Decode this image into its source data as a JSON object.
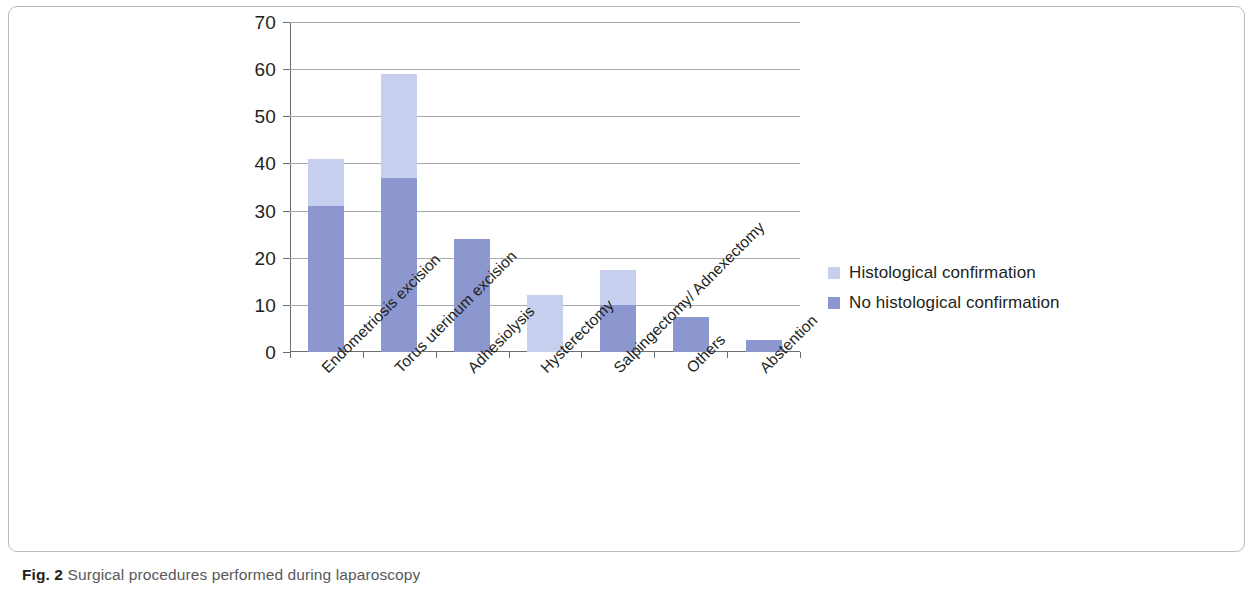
{
  "caption": {
    "label": "Fig. 2",
    "text": "Surgical procedures performed during laparoscopy"
  },
  "legend": {
    "items": [
      {
        "name": "Histological confirmation",
        "color": "#c6cfee"
      },
      {
        "name": "No histological confirmation",
        "color": "#8c97cf"
      }
    ]
  },
  "chart_data": {
    "type": "bar",
    "stacked": true,
    "title": "",
    "xlabel": "",
    "ylabel": "",
    "ylim": [
      0,
      70
    ],
    "yticks": [
      0,
      10,
      20,
      30,
      40,
      50,
      60,
      70
    ],
    "grid": true,
    "legend_position": "right",
    "categories": [
      "Endometriosis excision",
      "Torus uterinum excision",
      "Adhesiolysis",
      "Hysterectomy",
      "Salpingectomy/ Adnexectomy",
      "Others",
      "Abstention"
    ],
    "series": [
      {
        "name": "No histological confirmation",
        "color": "#8c97cf",
        "values": [
          31,
          37,
          24,
          0,
          10,
          7.5,
          2.5
        ]
      },
      {
        "name": "Histological confirmation",
        "color": "#c6cfee",
        "values": [
          10,
          22,
          0,
          12,
          7.5,
          0,
          0
        ]
      }
    ],
    "totals": [
      41,
      59,
      24,
      12,
      17.5,
      7.5,
      2.5
    ]
  }
}
